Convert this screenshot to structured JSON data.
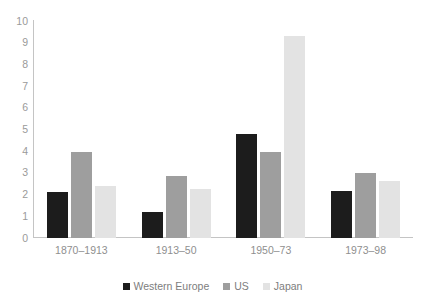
{
  "chart_data": {
    "type": "bar",
    "title": "",
    "subtitle": "",
    "xlabel": "",
    "ylabel": "",
    "categories": [
      "1870–1913",
      "1913–50",
      "1950–73",
      "1973–98"
    ],
    "series": [
      {
        "name": "Western Europe",
        "color": "#1c1c1c",
        "values": [
          2.1,
          1.2,
          4.8,
          2.15
        ]
      },
      {
        "name": "US",
        "color": "#9e9e9e",
        "values": [
          3.95,
          2.85,
          3.95,
          3.0
        ]
      },
      {
        "name": "Japan",
        "color": "#e3e3e3",
        "values": [
          2.4,
          2.25,
          9.3,
          2.65
        ]
      }
    ],
    "ylim": [
      0,
      10
    ],
    "yticks": [
      10,
      9,
      8,
      7,
      6,
      5,
      4,
      3,
      2,
      1,
      0
    ],
    "ytick_labels": [
      "10",
      "9",
      "8",
      "7",
      "6",
      "5",
      "4",
      "3",
      "2",
      "1",
      "0"
    ],
    "grid": false,
    "legend_position": "bottom",
    "axis_color": "#c4c4c4",
    "tick_label_color": "#9a9a9a",
    "legend_label_color": "#7d7d7d",
    "background": "#ffffff"
  },
  "legend": {
    "items": [
      {
        "label": "Western Europe"
      },
      {
        "label": "US"
      },
      {
        "label": "Japan"
      }
    ]
  }
}
